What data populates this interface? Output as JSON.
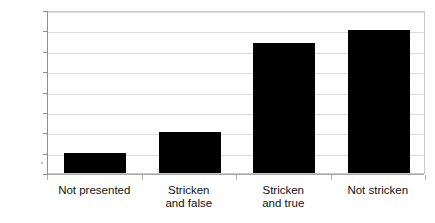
{
  "chart_data": {
    "type": "bar",
    "title": "",
    "xlabel": "",
    "ylabel": "",
    "categories": [
      "Not presented",
      "Stricken and false",
      "Stricken and true",
      "Not stricken"
    ],
    "category_lines": [
      [
        "Not presented"
      ],
      [
        "Stricken",
        "and false"
      ],
      [
        "Stricken",
        "and true"
      ],
      [
        "Not stricken"
      ]
    ],
    "values": [
      10,
      20,
      64,
      70
    ],
    "ylim": [
      0,
      80
    ],
    "ytick_values": [
      0,
      10,
      20,
      30,
      40,
      50,
      60,
      70,
      80
    ],
    "ytick_labels": [
      "0",
      "10",
      "20",
      "30",
      "40",
      "50",
      "60",
      "70",
      "80"
    ],
    "grid": true,
    "legend": false,
    "bar_color": "#000000",
    "gridline_color": "#dcdcdc",
    "axis_color": "#8f8f8f",
    "frame_color": "#c9c9c9",
    "background_color": "#ffffff"
  }
}
